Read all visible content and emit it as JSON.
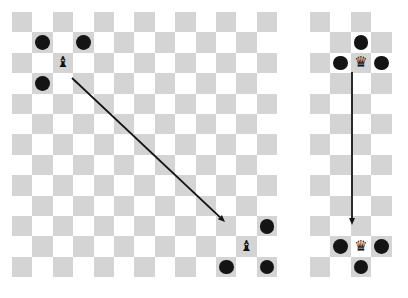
{
  "figure": {
    "background_color": "#ffffff",
    "width": 408,
    "height": 298
  },
  "palette": {
    "light_square": "#ffffff",
    "dark_square": "#d4d4d4",
    "dot_color": "#141414",
    "piece_color": "#111111",
    "arrow_color": "#141414"
  },
  "boards": [
    {
      "id": "left-board",
      "name": "bishop-board",
      "origin_x": 12,
      "origin_y": 12,
      "cols": 13,
      "rows": 13,
      "cell": 20.4,
      "pieces": [
        {
          "name": "bishop-top-left",
          "glyph": "♝",
          "type": "bishop",
          "col": 2,
          "row": 2,
          "size": 15
        },
        {
          "name": "bishop-bottom-right",
          "glyph": "♝",
          "type": "bishop",
          "col": 11,
          "row": 11,
          "size": 15
        }
      ],
      "dots": [
        {
          "name": "dot-top-left-a",
          "col": 1,
          "row": 1,
          "r": 7.4
        },
        {
          "name": "dot-top-left-b",
          "col": 3,
          "row": 1,
          "r": 7.4
        },
        {
          "name": "dot-top-left-c",
          "col": 1,
          "row": 3,
          "r": 7.4
        },
        {
          "name": "dot-bottom-right-a",
          "col": 12,
          "row": 10,
          "r": 7.4
        },
        {
          "name": "dot-bottom-right-b",
          "col": 10,
          "row": 12,
          "r": 7.4
        },
        {
          "name": "dot-bottom-right-c",
          "col": 12,
          "row": 12,
          "r": 7.4
        }
      ],
      "arrow": {
        "name": "diagonal-move-arrow",
        "x1": 72,
        "y1": 78,
        "x2": 225,
        "y2": 222,
        "width": 1.8,
        "head_size": 7
      }
    },
    {
      "id": "right-board",
      "name": "queen-board",
      "origin_x": 310,
      "origin_y": 12,
      "cols": 4,
      "rows": 13,
      "cell": 20.4,
      "pieces": [
        {
          "name": "queen-top",
          "glyph": "♛",
          "type": "queen",
          "col": 2,
          "row": 2,
          "size": 15
        },
        {
          "name": "queen-bottom",
          "glyph": "♛",
          "type": "queen",
          "col": 2,
          "row": 11,
          "size": 15
        }
      ],
      "dots": [
        {
          "name": "dot-queen-top-above",
          "col": 2,
          "row": 1,
          "r": 7.4
        },
        {
          "name": "dot-queen-top-left",
          "col": 1,
          "row": 2,
          "r": 7.4
        },
        {
          "name": "dot-queen-top-right",
          "col": 3,
          "row": 2,
          "r": 7.4
        },
        {
          "name": "dot-queen-bottom-left",
          "col": 1,
          "row": 11,
          "r": 7.4
        },
        {
          "name": "dot-queen-bottom-right",
          "col": 3,
          "row": 11,
          "r": 7.4
        },
        {
          "name": "dot-queen-bottom-below",
          "col": 2,
          "row": 12,
          "r": 7.4
        }
      ],
      "arrow": {
        "name": "vertical-move-arrow",
        "x1": 352,
        "y1": 72,
        "x2": 352,
        "y2": 225,
        "width": 1.8,
        "head_size": 7
      }
    }
  ]
}
